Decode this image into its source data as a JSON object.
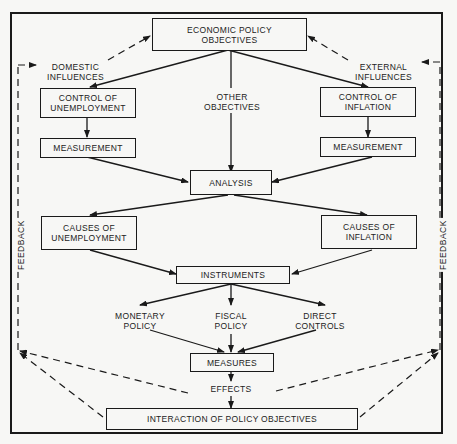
{
  "diagram": {
    "title": "ECONOMIC POLICY\nOBJECTIVES",
    "nodes": {
      "objectives": "ECONOMIC POLICY\nOBJECTIVES",
      "domestic": "DOMESTIC\nINFLUENCES",
      "external": "EXTERNAL\nINFLUENCES",
      "control_unemployment": "CONTROL OF\nUNEMPLOYMENT",
      "other_objectives": "OTHER\nOBJECTIVES",
      "control_inflation": "CONTROL OF\nINFLATION",
      "measurement_left": "MEASUREMENT",
      "measurement_right": "MEASUREMENT",
      "analysis": "ANALYSIS",
      "causes_unemployment": "CAUSES OF\nUNEMPLOYMENT",
      "causes_inflation": "CAUSES OF\nINFLATION",
      "instruments": "INSTRUMENTS",
      "monetary": "MONETARY\nPOLICY",
      "fiscal": "FISCAL\nPOLICY",
      "direct": "DIRECT\nCONTROLS",
      "measures": "MEASURES",
      "effects": "EFFECTS",
      "interaction": "INTERACTION OF POLICY OBJECTIVES",
      "feedback_left": "FEEDBACK",
      "feedback_right": "FEEDBACK"
    },
    "edges": [
      [
        "objectives",
        "control_unemployment",
        "solid"
      ],
      [
        "objectives",
        "other_objectives",
        "solid"
      ],
      [
        "objectives",
        "control_inflation",
        "solid"
      ],
      [
        "domestic",
        "objectives",
        "dashed"
      ],
      [
        "external",
        "objectives",
        "dashed"
      ],
      [
        "control_unemployment",
        "measurement_left",
        "solid"
      ],
      [
        "control_inflation",
        "measurement_right",
        "solid"
      ],
      [
        "measurement_left",
        "analysis",
        "solid"
      ],
      [
        "other_objectives",
        "analysis",
        "solid"
      ],
      [
        "measurement_right",
        "analysis",
        "solid"
      ],
      [
        "analysis",
        "causes_unemployment",
        "solid"
      ],
      [
        "analysis",
        "causes_inflation",
        "solid"
      ],
      [
        "causes_unemployment",
        "instruments",
        "solid"
      ],
      [
        "causes_inflation",
        "instruments",
        "solid"
      ],
      [
        "instruments",
        "monetary",
        "solid"
      ],
      [
        "instruments",
        "fiscal",
        "solid"
      ],
      [
        "instruments",
        "direct",
        "solid"
      ],
      [
        "monetary",
        "measures",
        "solid"
      ],
      [
        "fiscal",
        "measures",
        "solid"
      ],
      [
        "direct",
        "measures",
        "solid"
      ],
      [
        "measures",
        "effects",
        "solid"
      ],
      [
        "effects",
        "interaction",
        "solid"
      ],
      [
        "effects",
        "feedback_left",
        "dashed"
      ],
      [
        "effects",
        "feedback_right",
        "dashed"
      ],
      [
        "interaction",
        "feedback_left",
        "dashed"
      ],
      [
        "interaction",
        "feedback_right",
        "dashed"
      ],
      [
        "feedback_left",
        "domestic",
        "dashed"
      ],
      [
        "feedback_right",
        "external",
        "dashed"
      ]
    ]
  }
}
